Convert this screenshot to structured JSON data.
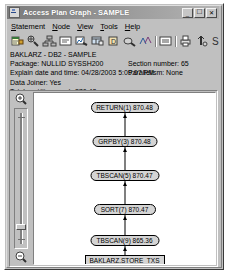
{
  "window": {
    "title": "Access Plan Graph - SAMPLE",
    "icon": "app-icon",
    "buttons": {
      "minimize": "_",
      "maximize": "□",
      "close": "✕"
    }
  },
  "menubar": {
    "items": [
      {
        "label": "Statement",
        "mnemonic": "S"
      },
      {
        "label": "Node",
        "mnemonic": "N"
      },
      {
        "label": "View",
        "mnemonic": "V"
      },
      {
        "label": "Tools",
        "mnemonic": "T"
      },
      {
        "label": "Help",
        "mnemonic": "H"
      }
    ]
  },
  "toolbar": {
    "items": [
      {
        "name": "show-statement-icon",
        "tooltip": "Show statement"
      },
      {
        "name": "show-optimized-statement-icon",
        "tooltip": "Show optimized statement"
      },
      {
        "name": "show-access-plan-icon",
        "tooltip": "Show access plan"
      },
      {
        "name": "show-node-details-icon",
        "tooltip": "Show node details"
      },
      {
        "name": "show-statistics-icon",
        "tooltip": "Show statistics"
      },
      {
        "name": "show-table-icon",
        "tooltip": "Show table"
      },
      {
        "name": "show-index-icon",
        "tooltip": "Show index"
      },
      {
        "name": "show-operator-details-icon",
        "tooltip": "Show operator details"
      },
      {
        "name": "graph-legend-icon",
        "tooltip": "Graph legend"
      },
      {
        "separator": true
      },
      {
        "name": "show-explain-text-icon",
        "tooltip": "Show explain text"
      },
      {
        "separator": true
      },
      {
        "name": "print-icon",
        "tooltip": "Print"
      },
      {
        "name": "optimization-icon",
        "tooltip": "Optimization"
      },
      {
        "name": "statistics-icon",
        "tooltip": "Statistics"
      }
    ]
  },
  "info": {
    "header": "BAKLARZ - DB2 - SAMPLE",
    "rows": [
      {
        "left": "Package: NULLID SYSSH200",
        "right": "Section number: 65"
      },
      {
        "left": "Explain date and time: 04/28/2003 5:09:07 PM",
        "right": "Parallelism: None"
      },
      {
        "left": "Data Joiner: Yes",
        "right": ""
      },
      {
        "left": "Total cost(timerons): 870.48",
        "right": ""
      }
    ]
  },
  "zoom_slider": {
    "zoom_in_icon": "magnifier-plus-icon",
    "zoom_out_icon": "magnifier-minus-icon",
    "value_position_percent": 12
  },
  "graph": {
    "nodes": [
      {
        "id": "n1",
        "label": "RETURN(1) 870.48",
        "shape": "rounded",
        "x": 50,
        "y": 9,
        "width": 68
      },
      {
        "id": "n2",
        "label": "GRPBY(3) 870.48",
        "shape": "rounded",
        "x": 50,
        "y": 43,
        "width": 65
      },
      {
        "id": "n3",
        "label": "TBSCAN(5) 870.47",
        "shape": "rounded",
        "x": 50,
        "y": 77,
        "width": 69
      },
      {
        "id": "n4",
        "label": "SORT(7) 870.47",
        "shape": "rounded",
        "x": 50,
        "y": 111,
        "width": 62
      },
      {
        "id": "n5",
        "label": "TBSCAN(9) 865.36",
        "shape": "rounded",
        "x": 50,
        "y": 142,
        "width": 69
      },
      {
        "id": "n6",
        "label": "BAKLARZ.STORE_TXS",
        "shape": "rectangle",
        "x": 50,
        "y": 162,
        "width": 80
      }
    ],
    "edges": [
      {
        "from": "n2",
        "to": "n1"
      },
      {
        "from": "n3",
        "to": "n2"
      },
      {
        "from": "n4",
        "to": "n3"
      },
      {
        "from": "n5",
        "to": "n4"
      },
      {
        "from": "n6",
        "to": "n5"
      }
    ]
  },
  "colors": {
    "node_fill": "#d4d4d4",
    "node_border": "#000000",
    "window_face": "#c0c0c0",
    "canvas": "#ffffff",
    "title_start": "#7b7b7b",
    "title_end": "#b4b4b4"
  }
}
